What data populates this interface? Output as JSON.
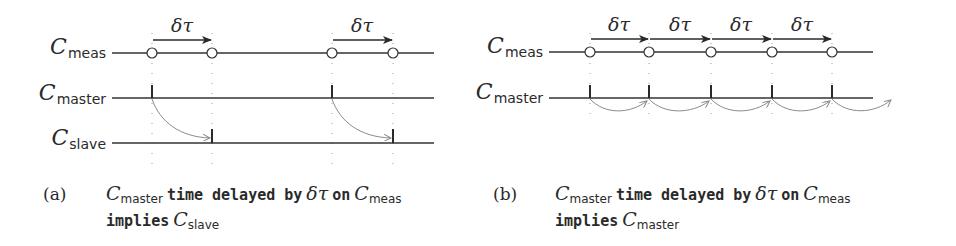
{
  "colors": {
    "ink": "#2a2a2a",
    "timeline": "#333333",
    "guide": "#9a9a9a",
    "curve": "#8a8a8a"
  },
  "panel_a": {
    "tag": "(a)",
    "clocks": [
      {
        "main": "C",
        "sub": "meas"
      },
      {
        "main": "C",
        "sub": "master"
      },
      {
        "main": "C",
        "sub": "slave"
      }
    ],
    "delta_labels": [
      "δτ",
      "δτ"
    ],
    "caption": {
      "line1": {
        "c1_main": "C",
        "c1_sub": "master",
        "text1": "time delayed by",
        "delta": "δτ",
        "text2": "on",
        "c2_main": "C",
        "c2_sub": "meas"
      },
      "line2": {
        "text": "implies",
        "c_main": "C",
        "c_sub": "slave"
      }
    }
  },
  "panel_b": {
    "tag": "(b)",
    "clocks": [
      {
        "main": "C",
        "sub": "meas"
      },
      {
        "main": "C",
        "sub": "master"
      }
    ],
    "delta_labels": [
      "δτ",
      "δτ",
      "δτ",
      "δτ"
    ],
    "caption": {
      "line1": {
        "c1_main": "C",
        "c1_sub": "master",
        "text1": "time delayed by",
        "delta": "δτ",
        "text2": "on",
        "c2_main": "C",
        "c2_sub": "meas"
      },
      "line2": {
        "text": "implies",
        "c_main": "C",
        "c_sub": "master"
      }
    }
  }
}
